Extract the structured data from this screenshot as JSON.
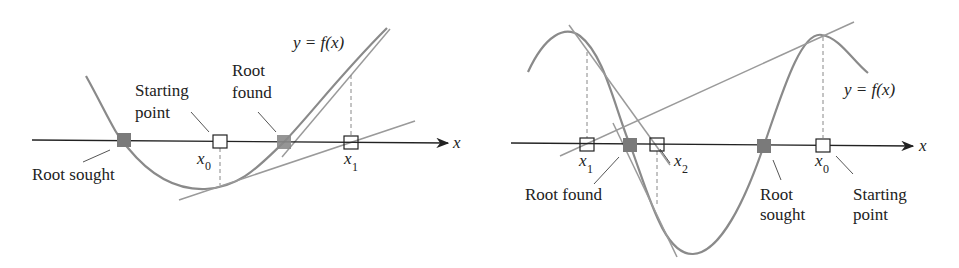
{
  "left_panel": {
    "curve_label": "y = f(x)",
    "axis_label": "x",
    "starting_point_label": [
      "Starting",
      "point"
    ],
    "root_found_label": [
      "Root",
      "found"
    ],
    "root_sought_label": "Root sought",
    "x0": {
      "var": "x",
      "sub": "0"
    },
    "x1": {
      "var": "x",
      "sub": "1"
    }
  },
  "right_panel": {
    "curve_label": "y = f(x)",
    "axis_label": "x",
    "starting_point_label": [
      "Starting",
      "point"
    ],
    "root_found_label": "Root found",
    "root_sought_label": [
      "Root",
      "sought"
    ],
    "x0": {
      "var": "x",
      "sub": "0"
    },
    "x1": {
      "var": "x",
      "sub": "1"
    },
    "x2": {
      "var": "x",
      "sub": "2"
    }
  },
  "colors": {
    "curve": "#8a8a8a",
    "tangent": "#9a9a9a",
    "axis": "#222222",
    "root_marker": "#7a7a7a",
    "iterate_marker": "#ffffff"
  }
}
